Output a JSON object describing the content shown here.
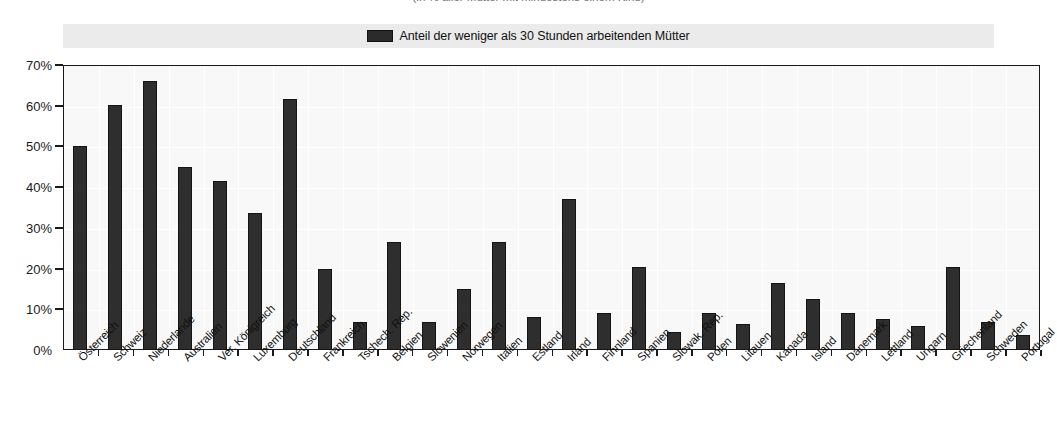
{
  "title_fragment": "(in % aller Mütter mit mindestens einem Kind)",
  "legend": {
    "label": "Anteil der weniger als 30 Stunden arbeitenden Mütter",
    "swatch_color": "#2b2b2b"
  },
  "axis": {
    "y_ticks": [
      "0%",
      "10%",
      "20%",
      "30%",
      "40%",
      "50%",
      "60%",
      "70%"
    ]
  },
  "chart_data": {
    "type": "bar",
    "title": "(in % aller Mütter mit mindestens einem Kind)",
    "xlabel": "",
    "ylabel": "",
    "ylim": [
      0,
      70
    ],
    "ytick_step": 10,
    "ytick_format": "percent",
    "grid": true,
    "legend_position": "top",
    "series": [
      {
        "name": "Anteil der weniger als 30 Stunden arbeitenden Mütter",
        "color": "#2e2e2e",
        "values": [
          50.0,
          60.3,
          66.0,
          45.0,
          41.6,
          33.7,
          61.6,
          20.0,
          7.0,
          26.5,
          7.0,
          15.0,
          26.5,
          8.2,
          37.0,
          9.0,
          20.5,
          4.5,
          9.0,
          6.4,
          16.5,
          12.6,
          9.0,
          7.7,
          5.8,
          20.3,
          6.8,
          3.6
        ]
      }
    ],
    "categories": [
      "Österreich",
      "Schweiz",
      "Niederlande",
      "Australien",
      "Ver. Königreich",
      "Luxemburg",
      "Deutschland",
      "Frankreich",
      "Tschech. Rep.",
      "Belgien",
      "Slowenien",
      "Norwegen",
      "Italien",
      "Estland",
      "Irland",
      "Finnland",
      "Spanien",
      "Slowak. Rep.",
      "Polen",
      "Litauen",
      "Kanada",
      "Island",
      "Dänemark",
      "Lettland",
      "Ungarn",
      "Griechenland",
      "Schweden",
      "Portugal"
    ]
  }
}
